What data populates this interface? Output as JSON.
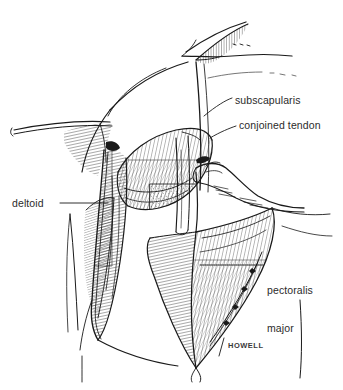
{
  "figure": {
    "title_fragment": "",
    "artist_signature": "HOWELL",
    "labels": {
      "subscapularis": "subscapularis",
      "conjoined_tendon": "conjoined tendon",
      "deltoid": "deltoid",
      "pectoralis_line1": "pectoralis",
      "pectoralis_line2": "major"
    },
    "colors": {
      "background": "#ffffff",
      "ink": "#1a1a1a",
      "label_text": "#2b2b2b",
      "signature": "#3a3a3a"
    }
  }
}
